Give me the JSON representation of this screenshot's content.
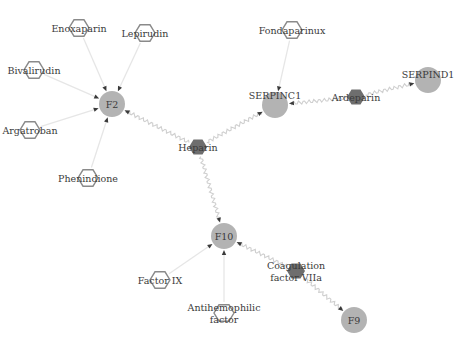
{
  "diagram": {
    "type": "network",
    "colors": {
      "protein_node": "#b3b3b3",
      "drug_outline": "#8a8a8a",
      "drug_dark": "#6e6e6e",
      "edge_plain": "#e6e6e6",
      "edge_wavy": "#cfcfcf",
      "arrow": "#3a3a3a",
      "text": "#3a3a3a"
    },
    "nodes": [
      {
        "id": "f2",
        "label": "F2",
        "kind": "protein",
        "x": 112,
        "y": 104
      },
      {
        "id": "serpinc1",
        "label": "SERPINC1",
        "kind": "protein",
        "x": 275,
        "y": 105
      },
      {
        "id": "serpind1",
        "label": "SERPIND1",
        "kind": "protein",
        "x": 428,
        "y": 80
      },
      {
        "id": "f10",
        "label": "F10",
        "kind": "protein",
        "x": 224,
        "y": 236
      },
      {
        "id": "f9",
        "label": "F9",
        "kind": "protein",
        "x": 354,
        "y": 320
      },
      {
        "id": "heparin",
        "label": "Heparin",
        "kind": "drug-dark",
        "x": 198,
        "y": 147
      },
      {
        "id": "ardeparin",
        "label": "Ardeparin",
        "kind": "drug-dark",
        "x": 356,
        "y": 97
      },
      {
        "id": "fvIIa",
        "label": "Coagulation factor VIIa",
        "label_lines": [
          "Coagulation",
          "factor VIIa"
        ],
        "kind": "drug-dark",
        "x": 296,
        "y": 271
      },
      {
        "id": "enoxaparin",
        "label": "Enoxaparin",
        "kind": "drug",
        "x": 79,
        "y": 28
      },
      {
        "id": "lepirudin",
        "label": "Lepirudin",
        "kind": "drug",
        "x": 145,
        "y": 33
      },
      {
        "id": "bivalirudin",
        "label": "Bivalirudin",
        "kind": "drug",
        "x": 34,
        "y": 70
      },
      {
        "id": "argatroban",
        "label": "Argatroban",
        "kind": "drug",
        "x": 30,
        "y": 130
      },
      {
        "id": "phenindione",
        "label": "Phenindione",
        "kind": "drug",
        "x": 88,
        "y": 178
      },
      {
        "id": "fondaparinux",
        "label": "Fondaparinux",
        "kind": "drug",
        "x": 292,
        "y": 30
      },
      {
        "id": "factor_ix",
        "label": "Factor IX",
        "kind": "drug",
        "x": 160,
        "y": 280
      },
      {
        "id": "antihemophilic",
        "label": "Antihemophilic factor",
        "label_lines": [
          "Antihemophilic",
          "factor"
        ],
        "kind": "drug",
        "x": 224,
        "y": 313
      }
    ],
    "edges": [
      {
        "from": "enoxaparin",
        "to": "f2",
        "style": "plain"
      },
      {
        "from": "lepirudin",
        "to": "f2",
        "style": "plain"
      },
      {
        "from": "bivalirudin",
        "to": "f2",
        "style": "plain"
      },
      {
        "from": "argatroban",
        "to": "f2",
        "style": "plain"
      },
      {
        "from": "phenindione",
        "to": "f2",
        "style": "plain"
      },
      {
        "from": "heparin",
        "to": "f2",
        "style": "wavy"
      },
      {
        "from": "heparin",
        "to": "serpinc1",
        "style": "wavy"
      },
      {
        "from": "heparin",
        "to": "f10",
        "style": "wavy"
      },
      {
        "from": "fondaparinux",
        "to": "serpinc1",
        "style": "plain"
      },
      {
        "from": "ardeparin",
        "to": "serpinc1",
        "style": "wavy"
      },
      {
        "from": "ardeparin",
        "to": "serpind1",
        "style": "wavy"
      },
      {
        "from": "factor_ix",
        "to": "f10",
        "style": "plain"
      },
      {
        "from": "antihemophilic",
        "to": "f10",
        "style": "plain"
      },
      {
        "from": "fvIIa",
        "to": "f10",
        "style": "wavy"
      },
      {
        "from": "fvIIa",
        "to": "f9",
        "style": "wavy"
      }
    ]
  }
}
